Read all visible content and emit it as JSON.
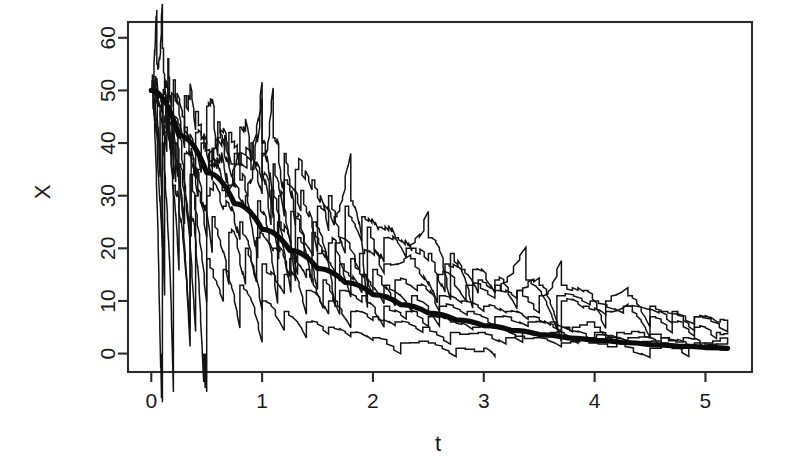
{
  "chart_data": {
    "type": "line",
    "title": "",
    "xlabel": "t",
    "ylabel": "X",
    "xlim": [
      -0.21,
      5.42
    ],
    "ylim": [
      -3.5,
      63.0
    ],
    "grid": false,
    "legend": null,
    "x_ticks": [
      0,
      1,
      2,
      3,
      4,
      5
    ],
    "x_tick_labels": [
      "0",
      "1",
      "2",
      "3",
      "4",
      "5"
    ],
    "y_ticks": [
      0,
      10,
      20,
      30,
      40,
      50,
      60
    ],
    "y_tick_labels": [
      "0",
      "10",
      "20",
      "30",
      "40",
      "50",
      "60"
    ],
    "series": [
      {
        "name": "mean",
        "style": "thick-smooth",
        "model": "50*exp(-0.75*t)",
        "x": [
          0,
          0.25,
          0.5,
          0.75,
          1.0,
          1.25,
          1.5,
          1.75,
          2.0,
          2.25,
          2.5,
          2.75,
          3.0,
          3.25,
          3.5,
          3.75,
          4.0,
          4.25,
          4.5,
          4.75,
          5.0,
          5.2
        ],
        "values": [
          50.0,
          41.4,
          34.4,
          28.5,
          23.6,
          19.6,
          16.2,
          13.5,
          11.2,
          9.3,
          7.7,
          6.4,
          5.3,
          4.4,
          3.6,
          3.0,
          2.5,
          2.1,
          1.7,
          1.4,
          1.2,
          1.0
        ]
      },
      {
        "name": "path-1",
        "style": "step",
        "x": [
          0,
          0.05,
          0.1,
          0.15,
          0.2,
          0.3,
          0.4,
          0.5,
          0.6,
          0.7,
          0.8,
          0.9,
          1.0,
          1.1,
          1.2,
          1.3,
          1.45,
          1.6,
          1.75,
          1.9,
          2.05,
          2.2,
          2.35,
          2.5,
          2.65,
          2.8,
          2.95,
          3.1,
          3.3,
          3.5,
          3.7,
          3.9,
          4.1,
          4.3,
          4.5,
          4.7,
          4.9,
          5.1,
          5.2
        ],
        "values": [
          50,
          55,
          58,
          56,
          52,
          49,
          46,
          47,
          44,
          42,
          43,
          40,
          38,
          41,
          38,
          35,
          33,
          30,
          28,
          26,
          24,
          22,
          20,
          19,
          17,
          16,
          14,
          13,
          12,
          11,
          13,
          12,
          10,
          11,
          9,
          8,
          7,
          6,
          6
        ]
      },
      {
        "name": "path-2",
        "style": "step",
        "x": [
          0,
          0.1,
          0.2,
          0.3,
          0.45,
          0.6,
          0.75,
          0.9,
          1.0,
          1.1,
          1.2,
          1.35,
          1.5,
          1.65,
          1.8,
          1.95,
          2.1,
          2.3,
          2.5,
          2.7,
          2.9,
          3.1,
          3.3,
          3.5,
          3.7,
          3.9,
          4.1,
          4.3,
          4.5,
          4.7,
          4.9,
          5.1,
          5.2
        ],
        "values": [
          50,
          48,
          45,
          43,
          40,
          41,
          38,
          37,
          40,
          36,
          33,
          31,
          28,
          26,
          29,
          24,
          22,
          20,
          22,
          19,
          16,
          14,
          12,
          13,
          10,
          9,
          8,
          9,
          7,
          6,
          5,
          4,
          4
        ]
      },
      {
        "name": "path-3",
        "style": "step",
        "x": [
          0,
          0.08,
          0.18,
          0.3,
          0.42,
          0.55,
          0.7,
          0.85,
          1.0,
          1.15,
          1.3,
          1.45,
          1.6,
          1.8,
          2.0,
          2.2,
          2.4,
          2.6,
          2.8,
          3.0,
          3.2,
          3.4,
          3.6,
          3.8,
          4.0,
          4.2,
          4.4,
          4.6,
          4.8,
          5.0,
          5.2
        ],
        "values": [
          50,
          46,
          42,
          38,
          35,
          36,
          32,
          30,
          34,
          30,
          26,
          23,
          21,
          18,
          16,
          14,
          13,
          11,
          10,
          9,
          8,
          7,
          6,
          5,
          5,
          4,
          4,
          3,
          3,
          2,
          2
        ]
      },
      {
        "name": "path-4",
        "style": "step",
        "x": [
          0,
          0.1,
          0.22,
          0.35,
          0.5,
          0.65,
          0.8,
          0.95,
          1.1,
          1.25,
          1.4,
          1.55,
          1.7,
          1.9,
          2.1,
          2.3,
          2.5,
          2.7,
          2.9,
          3.1,
          3.35,
          3.6,
          3.85,
          4.1,
          4.35,
          4.6,
          4.85,
          5.1,
          5.2
        ],
        "values": [
          50,
          44,
          40,
          34,
          30,
          28,
          25,
          22,
          20,
          18,
          16,
          14,
          12,
          11,
          9,
          8,
          7,
          6,
          5,
          5,
          4,
          4,
          3,
          3,
          2,
          2,
          1,
          1,
          1
        ]
      },
      {
        "name": "path-5",
        "style": "step",
        "x": [
          0,
          0.12,
          0.25,
          0.4,
          0.55,
          0.7,
          0.85,
          1.0,
          1.2,
          1.4,
          1.6,
          1.8,
          2.0,
          2.2,
          2.45,
          2.7,
          2.95,
          3.2,
          3.45,
          3.7,
          3.95,
          4.2,
          4.5,
          4.8,
          5.1,
          5.2
        ],
        "values": [
          50,
          42,
          36,
          30,
          26,
          23,
          20,
          17,
          15,
          12,
          10,
          8,
          7,
          6,
          5,
          4,
          4,
          3,
          3,
          2,
          2,
          2,
          1,
          1,
          1,
          1
        ]
      },
      {
        "name": "path-6",
        "style": "step",
        "x": [
          0,
          0.1,
          0.2,
          0.35,
          0.5,
          0.65,
          0.8,
          1.0,
          1.2,
          1.4,
          1.6,
          1.8,
          2.0,
          2.25,
          2.5,
          2.75,
          3.0,
          3.1
        ],
        "values": [
          50,
          40,
          32,
          26,
          18,
          16,
          13,
          10,
          8,
          6,
          5,
          4,
          3,
          2,
          2,
          1,
          1,
          0
        ]
      },
      {
        "name": "path-7",
        "style": "step",
        "x": [
          0,
          0.06,
          0.14,
          0.24,
          0.36,
          0.5,
          0.64,
          0.8,
          0.96,
          1.14,
          1.32,
          1.5,
          1.7,
          1.9,
          2.1,
          2.35,
          2.6,
          2.85,
          3.1,
          3.4,
          3.7,
          4.0,
          4.3,
          4.6,
          4.9,
          5.2
        ],
        "values": [
          50,
          47,
          44,
          41,
          37,
          34,
          31,
          33,
          29,
          25,
          22,
          19,
          17,
          15,
          13,
          11,
          9,
          8,
          7,
          6,
          5,
          4,
          3,
          3,
          2,
          2
        ]
      },
      {
        "name": "path-8",
        "style": "step",
        "x": [
          0,
          0.07,
          0.16,
          0.28,
          0.4,
          0.55,
          0.72,
          0.9,
          1.08,
          1.26,
          1.46,
          1.66,
          1.88,
          2.1,
          2.34,
          2.58,
          2.84,
          3.1,
          3.38,
          3.66,
          3.96,
          4.26,
          4.58,
          4.9,
          5.2
        ],
        "values": [
          50,
          49,
          47,
          45,
          42,
          39,
          36,
          35,
          31,
          27,
          25,
          21,
          19,
          17,
          18,
          15,
          13,
          12,
          14,
          11,
          10,
          9,
          8,
          7,
          6
        ]
      }
    ]
  },
  "axes": {
    "x_label": "t",
    "y_label": "X"
  }
}
